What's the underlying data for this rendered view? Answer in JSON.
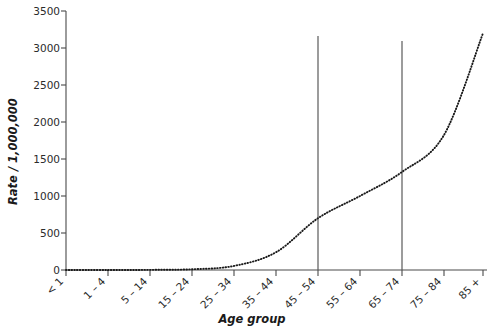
{
  "chart_data": {
    "type": "line",
    "title": "",
    "xlabel": "Age group",
    "ylabel": "Rate / 1,000,000",
    "categories": [
      "< 1",
      "1 – 4",
      "5 – 14",
      "15 – 24",
      "25 – 34",
      "35 – 44",
      "45 – 54",
      "55 – 64",
      "65 – 74",
      "75 – 84",
      "85 +"
    ],
    "values": [
      0,
      0,
      2,
      10,
      55,
      240,
      700,
      1000,
      1325,
      1825,
      3200
    ],
    "series": [
      {
        "name": "Rate",
        "style": "dotted",
        "color": "#1a1a1a",
        "values": [
          0,
          0,
          2,
          10,
          55,
          240,
          700,
          1000,
          1325,
          1825,
          3200
        ]
      }
    ],
    "ylim": [
      0,
      3500
    ],
    "yticks": [
      0,
      500,
      1000,
      1500,
      2000,
      2500,
      3000,
      3500
    ],
    "ytick_labels": [
      "0",
      "500",
      "1000",
      "1500",
      "2000",
      "2500",
      "3000",
      "3500"
    ],
    "grid": false,
    "legend": null,
    "annotations": [
      {
        "type": "vertical-reference-line",
        "at_category": "45 – 54",
        "top_value": 3150,
        "bottom_value": 0
      },
      {
        "type": "vertical-reference-line",
        "at_category": "65 – 74",
        "top_value": 3080,
        "bottom_value": 0
      }
    ],
    "x_tick_label_rotation_deg": 45,
    "background_color": "#ffffff",
    "axis_color": "#4a4a4a"
  }
}
